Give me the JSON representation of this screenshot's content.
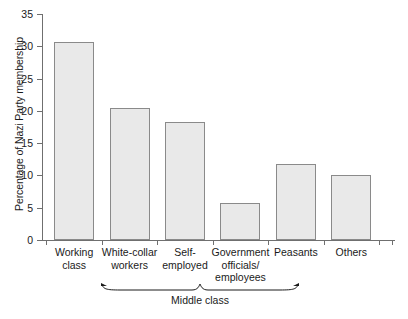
{
  "chart_data": {
    "type": "bar",
    "title": "",
    "xlabel": "",
    "ylabel": "Percentage of Nazi Party membership",
    "ylim": [
      0,
      35
    ],
    "ytick_step": 5,
    "yticks": [
      "0",
      "5",
      "10",
      "15",
      "20",
      "25",
      "30",
      "35"
    ],
    "grid": false,
    "legend": null,
    "categories": [
      "Working\nclass",
      "White-collar\nworkers",
      "Self-\nemployed",
      "Government\nofficials/\nemployees",
      "Peasants",
      "Others"
    ],
    "values": [
      30.6,
      20.4,
      18.2,
      5.8,
      11.7,
      10.1
    ],
    "annotations": [
      {
        "text": "Middle class",
        "type": "group-bracket",
        "spans": [
          "White-collar\nworkers",
          "Self-\nemployed",
          "Government\nofficials/\nemployees"
        ]
      }
    ],
    "colors": {
      "bar_fill": "#e9e9e9",
      "bar_stroke": "#8a8a8a",
      "axis": "#6f6f6f",
      "text": "#1a1a1a",
      "background": "#ffffff"
    }
  }
}
